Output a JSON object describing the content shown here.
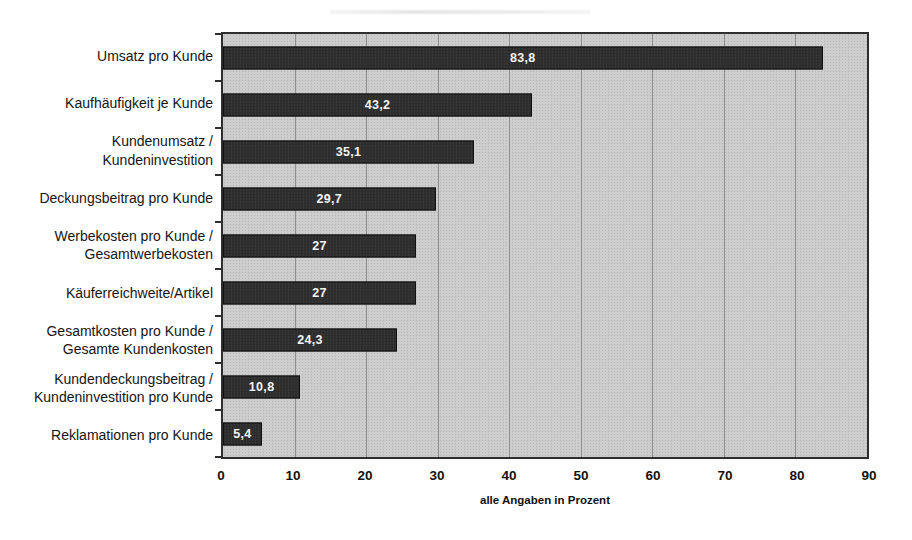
{
  "chart_data": {
    "type": "bar",
    "orientation": "horizontal",
    "title": "",
    "xlabel": "alle Angaben in Prozent",
    "ylabel": "",
    "xlim": [
      0,
      90
    ],
    "x_ticks": [
      0,
      10,
      20,
      30,
      40,
      50,
      60,
      70,
      80,
      90
    ],
    "grid": "vertical",
    "legend": "none",
    "categories": [
      "Umsatz pro Kunde",
      "Kaufhäufigkeit je Kunde",
      "Kundenumsatz / Kundeninvestition",
      "Deckungsbeitrag pro Kunde",
      "Werbekosten pro Kunde / Gesamtwerbekosten",
      "Käuferreichweite/Artikel",
      "Gesamtkosten pro Kunde / Gesamte Kundenkosten",
      "Kundendeckungsbeitrag / Kundeninvestition pro Kunde",
      "Reklamationen pro Kunde"
    ],
    "category_lines": [
      [
        "Umsatz pro Kunde"
      ],
      [
        "Kaufhäufigkeit je Kunde"
      ],
      [
        "Kundenumsatz /",
        "Kundeninvestition"
      ],
      [
        "Deckungsbeitrag pro Kunde"
      ],
      [
        "Werbekosten pro Kunde /",
        "Gesamtwerbekosten"
      ],
      [
        "Käuferreichweite/Artikel"
      ],
      [
        "Gesamtkosten pro Kunde /",
        "Gesamte Kundenkosten"
      ],
      [
        "Kundendeckungsbeitrag /",
        "Kundeninvestition pro Kunde"
      ],
      [
        "Reklamationen pro Kunde"
      ]
    ],
    "values": [
      83.8,
      43.2,
      35.1,
      29.7,
      27,
      27,
      24.3,
      10.8,
      5.4
    ],
    "value_labels": [
      "83,8",
      "43,2",
      "35,1",
      "29,7",
      "27",
      "27",
      "24,3",
      "10,8",
      "5,4"
    ],
    "colors": {
      "bar": "#2d2d2d",
      "bar_border": "#101010",
      "value_text": "#f4f4f4",
      "plot_background": "#cdcdcd",
      "gridline": "#8f8f8f",
      "plot_border": "#2e2e2e",
      "text": "#151515"
    }
  }
}
